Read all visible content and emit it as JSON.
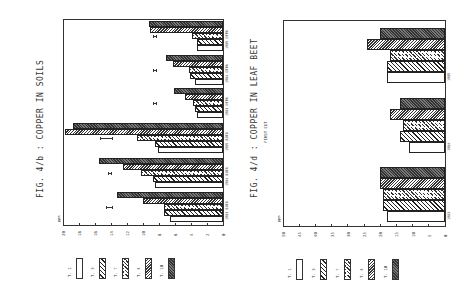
{
  "figures": [
    {
      "id": "fig4b",
      "title": "FIG. 4/b : COPPER IN SOILS",
      "unit": "ppm"
    },
    {
      "id": "fig4d",
      "title": "FIG. 4/d : COPPER IN LEAF BEET",
      "subtitle": "FIRST CUT",
      "unit": "ppm"
    }
  ],
  "legend": [
    {
      "label": "T. 1",
      "pattern": "open"
    },
    {
      "label": "T. 3",
      "pattern": "hatch"
    },
    {
      "label": "T. 7",
      "pattern": "cross"
    },
    {
      "label": "T. 4",
      "pattern": "dense"
    },
    {
      "label": "T. 10",
      "pattern": "dark"
    }
  ],
  "chart_data": [
    {
      "type": "bar",
      "orientation": "horizontal (figure rotated 90°)",
      "title": "FIG. 4/b : COPPER IN SOILS",
      "ylabel": "ppm",
      "ylim": [
        0,
        20
      ],
      "yticks": [
        0,
        2,
        4,
        6,
        8,
        10,
        12,
        14,
        16,
        18,
        20
      ],
      "categories": [
        "1983 EDTA",
        "1984 EDTA",
        "1985 EDTA",
        "1983 DTPA",
        "1984 DTPA",
        "1985 DTPA"
      ],
      "series": [
        {
          "name": "T. 1",
          "values": [
            6.6,
            8.5,
            8.1,
            3.3,
            3.5,
            3.3
          ]
        },
        {
          "name": "T. 3",
          "values": [
            7.4,
            8.7,
            8.5,
            3.5,
            4.1,
            3.3
          ]
        },
        {
          "name": "T. 7",
          "values": [
            7.4,
            10.2,
            10.8,
            3.7,
            4.3,
            3.9
          ]
        },
        {
          "name": "T. 4",
          "values": [
            10.0,
            12.5,
            19.8,
            4.8,
            6.2,
            9.1
          ]
        },
        {
          "name": "T. 10",
          "values": [
            13.3,
            15.5,
            18.7,
            6.1,
            7.1,
            9.3
          ]
        }
      ],
      "error_bars": [
        {
          "category": "1983 EDTA",
          "center": 14.2,
          "half_width": 0.4
        },
        {
          "category": "1984 EDTA",
          "center": 14.1,
          "half_width": 0.2
        },
        {
          "category": "1985 EDTA",
          "center": 14.6,
          "half_width": 0.8
        },
        {
          "category": "1983 DTPA",
          "center": 8.5,
          "half_width": 0.3
        },
        {
          "category": "1984 DTPA",
          "center": 8.5,
          "half_width": 0.3
        },
        {
          "category": "1985 DTPA",
          "center": 8.5,
          "half_width": 0.3
        }
      ],
      "legend_position": "below"
    },
    {
      "type": "bar",
      "orientation": "horizontal (figure rotated 90°)",
      "title": "FIG. 4/d : COPPER IN LEAF BEET",
      "subtitle": "FIRST CUT",
      "ylabel": "ppm",
      "ylim": [
        0,
        50
      ],
      "yticks": [
        0,
        5,
        10,
        15,
        20,
        25,
        30,
        35,
        40,
        45,
        50
      ],
      "categories": [
        "1983",
        "1984",
        "1985"
      ],
      "series": [
        {
          "name": "T. 1",
          "values": [
            18,
            11,
            18
          ]
        },
        {
          "name": "T. 3",
          "values": [
            19,
            14,
            18
          ]
        },
        {
          "name": "T. 7",
          "values": [
            19,
            13,
            17
          ]
        },
        {
          "name": "T. 4",
          "values": [
            20,
            17,
            24
          ]
        },
        {
          "name": "T. 10",
          "values": [
            20,
            14,
            20
          ]
        }
      ],
      "legend_position": "below"
    }
  ]
}
